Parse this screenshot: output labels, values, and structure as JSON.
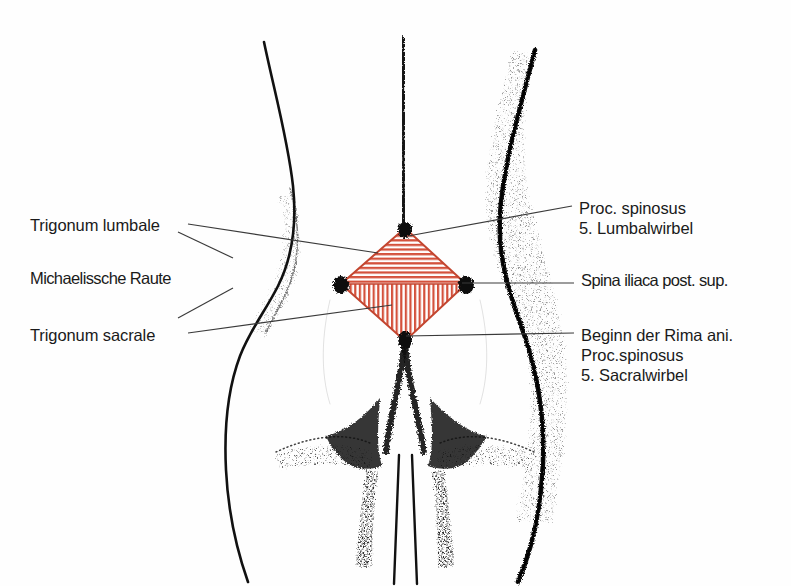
{
  "figure": {
    "kind": "anatomical-line-drawing",
    "language": "de",
    "background_color": "#fefefe",
    "ink_color": "#111111",
    "hatch_color": "#d4513c",
    "hatch_color_light": "#e9836f",
    "leader_color": "#3a3a3a"
  },
  "labels_left": [
    {
      "id": "trigonum-lumbale",
      "text": "Trigonum lumbale",
      "x": 30,
      "y": 215
    },
    {
      "id": "michaelissche-raute",
      "text": "Michaelissche Raute",
      "x": 30,
      "y": 268
    },
    {
      "id": "trigonum-sacrale",
      "text": "Trigonum sacrale",
      "x": 30,
      "y": 325
    }
  ],
  "labels_right": [
    {
      "id": "proc-spinosus-l5",
      "lines": [
        "Proc. spinosus",
        "5. Lumbalwirbel"
      ],
      "x": 579,
      "y": 198
    },
    {
      "id": "spina-iliaca-post-sup",
      "lines": [
        "Spina iliaca post. sup."
      ],
      "x": 581,
      "y": 270
    },
    {
      "id": "rima-ani-s5",
      "lines": [
        "Beginn der Rima ani.",
        "Proc.spinosus",
        "5. Sacralwirbel"
      ],
      "x": 581,
      "y": 325
    }
  ],
  "rhombus": {
    "name": "michaelis-rhomboid",
    "left": {
      "x": 341,
      "y": 284
    },
    "top": {
      "x": 405,
      "y": 228
    },
    "right": {
      "x": 466,
      "y": 284
    },
    "bottom": {
      "x": 405,
      "y": 341
    },
    "upper_triangle_hatch": "horizontal",
    "lower_triangle_hatch": "vertical",
    "upper_triangle_label": "Trigonum lumbale",
    "lower_triangle_label": "Trigonum sacrale"
  },
  "landmarks": [
    {
      "id": "proc-spinosus-l5",
      "x": 405,
      "y": 228,
      "note": "top vertex"
    },
    {
      "id": "spina-iliaca-post-sup-l",
      "x": 341,
      "y": 284,
      "note": "left vertex"
    },
    {
      "id": "spina-iliaca-post-sup-r",
      "x": 466,
      "y": 284,
      "note": "right vertex"
    },
    {
      "id": "rima-ani-start",
      "x": 405,
      "y": 341,
      "note": "bottom vertex"
    }
  ]
}
